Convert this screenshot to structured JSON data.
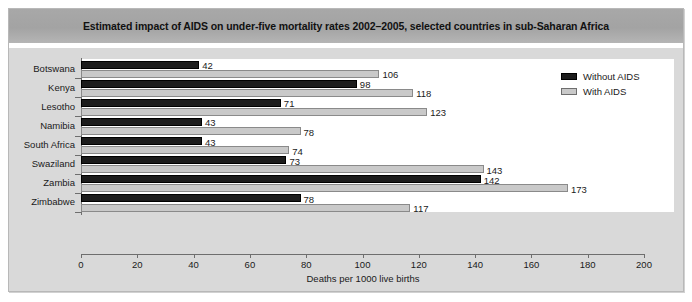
{
  "chart_data": {
    "type": "bar",
    "orientation": "horizontal",
    "title": "Estimated impact of AIDS on under-five mortality rates 2002–2005, selected countries in sub-Saharan Africa",
    "categories": [
      "Botswana",
      "Kenya",
      "Lesotho",
      "Namibia",
      "South Africa",
      "Swaziland",
      "Zambia",
      "Zimbabwe"
    ],
    "series": [
      {
        "name": "Without AIDS",
        "color": "#1c1c1c",
        "values": [
          42,
          98,
          71,
          43,
          43,
          73,
          142,
          78
        ]
      },
      {
        "name": "With AIDS",
        "color": "#c9c9c9",
        "values": [
          106,
          118,
          123,
          78,
          74,
          143,
          173,
          117
        ]
      }
    ],
    "xlabel": "Deaths per 1000 live births",
    "ylabel": "",
    "xlim": [
      0,
      200
    ],
    "xticks": [
      0,
      20,
      40,
      60,
      80,
      100,
      120,
      140,
      160,
      180,
      200
    ],
    "xtick_labels": [
      "0",
      "20",
      "40",
      "60",
      "80",
      "100",
      "120",
      "140",
      "160",
      "180",
      "200"
    ],
    "grid": false,
    "legend_position": "top-right",
    "data_labels": true
  },
  "legend": {
    "items": [
      {
        "label": "Without AIDS",
        "swatch": "black-swatch-icon"
      },
      {
        "label": "With AIDS",
        "swatch": "gray-swatch-icon"
      }
    ]
  },
  "colors": {
    "frame_background": "#d9d9d9",
    "title_band": "#a3a3a3",
    "plot_background": "#ffffff",
    "axis": "#6e6e6e",
    "without_aids": "#1c1c1c",
    "with_aids": "#c9c9c9"
  }
}
